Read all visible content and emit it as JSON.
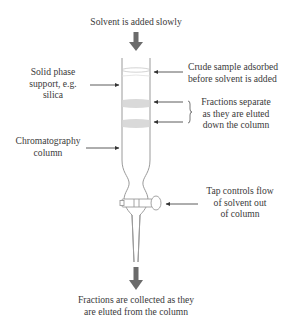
{
  "diagram": {
    "labels": {
      "top": "Solvent is added slowly",
      "solid_phase": [
        "Solid phase",
        "support, e.g.",
        "silica"
      ],
      "crude_sample": [
        "Crude sample adsorbed",
        "before solvent is added"
      ],
      "fractions_separate": [
        "Fractions separate",
        "as they are eluted",
        "down the column"
      ],
      "column": [
        "Chromatography",
        "column"
      ],
      "tap": [
        "Tap controls flow",
        "of solvent out",
        "of column"
      ],
      "bottom": [
        "Fractions are collected as they",
        "are eluted from the column"
      ]
    },
    "colors": {
      "arrow": "#6b6b6b",
      "outline": "#9a9a9a",
      "band": "#d9d9d9",
      "text": "#3a3a3a"
    }
  }
}
